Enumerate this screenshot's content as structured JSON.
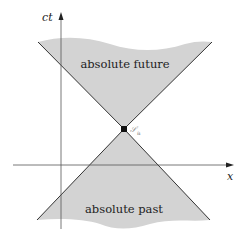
{
  "diagram": {
    "type": "light-cone spacetime diagram",
    "regions": {
      "future": "absolute future",
      "past": "absolute past"
    },
    "axes": {
      "vertical": "ct",
      "horizontal": "x"
    },
    "event": {
      "label": "𝒮",
      "subscript": "a"
    },
    "colors": {
      "cone_fill": "#d3d3d3",
      "cone_edge": "#333333",
      "axis": "#555555",
      "event_dot": "#111111"
    }
  }
}
